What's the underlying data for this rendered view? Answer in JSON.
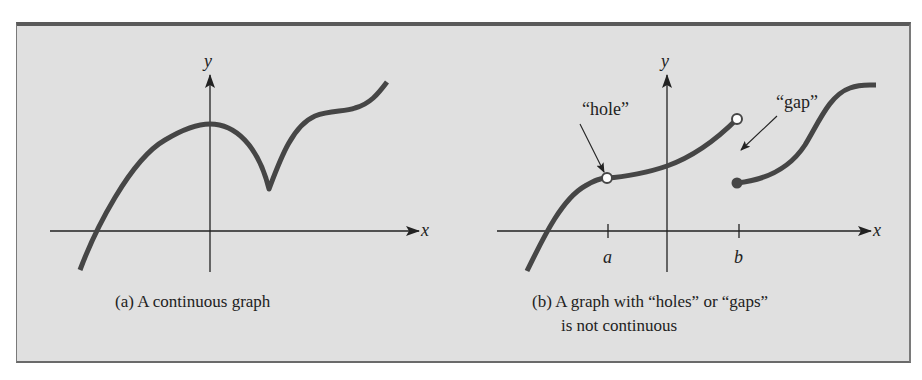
{
  "colors": {
    "background": "#e0e0e0",
    "frame_border": "#5a5a5a",
    "curve": "#464646",
    "axis": "#222222",
    "hole_fill": "#ffffff"
  },
  "panel_a": {
    "axis_x_label": "x",
    "axis_y_label": "y",
    "caption": "(a) A continuous graph",
    "curve_description": "continuous curve rising from lower-left, peaking at the y-axis, dipping to a cusp, then rising again to the upper right"
  },
  "panel_b": {
    "axis_x_label": "x",
    "axis_y_label": "y",
    "tick_labels": [
      "a",
      "b"
    ],
    "annotations": {
      "hole": "“hole”",
      "gap": "“gap”"
    },
    "caption_line1": "(b) A graph with “holes” or “gaps”",
    "caption_line2": "is not continuous",
    "features": [
      {
        "type": "open-circle",
        "at": "x = a",
        "meaning": "hole"
      },
      {
        "type": "open-circle",
        "at": "x = b (left piece end)",
        "meaning": "excluded endpoint"
      },
      {
        "type": "filled-dot",
        "at": "x = b (right piece start)",
        "meaning": "included endpoint"
      }
    ]
  }
}
